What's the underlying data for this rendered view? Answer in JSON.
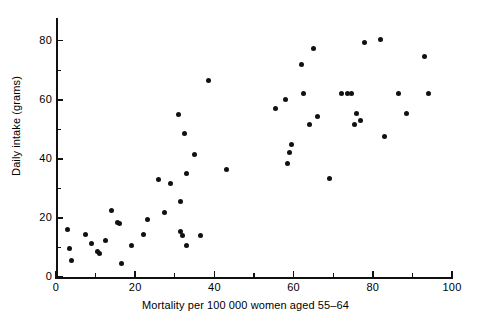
{
  "chart_data": {
    "type": "scatter",
    "title": "",
    "xlabel": "Mortality per 100 000 women aged 55–64",
    "ylabel": "Daily intake (grams)",
    "xlim": [
      0,
      100
    ],
    "ylim": [
      0,
      87
    ],
    "grid": false,
    "legend": null,
    "x_ticks_major": [
      0,
      20,
      40,
      60,
      80,
      100
    ],
    "x_tick_labels": [
      "0",
      "20",
      "40",
      "60",
      "80",
      "100"
    ],
    "x_ticks_minor": [
      10,
      30,
      50,
      70,
      90
    ],
    "y_ticks_major": [
      0,
      20,
      40,
      60,
      80
    ],
    "y_tick_labels": [
      "0",
      "20",
      "40",
      "60",
      "80"
    ],
    "y_ticks_minor": [
      10,
      30,
      50,
      70
    ],
    "marker": "filled-circle",
    "marker_color": "#111111",
    "points": [
      {
        "x": 3.0,
        "y": 16.0
      },
      {
        "x": 3.5,
        "y": 9.5
      },
      {
        "x": 4.0,
        "y": 5.5
      },
      {
        "x": 7.5,
        "y": 14.5
      },
      {
        "x": 9.0,
        "y": 11.5
      },
      {
        "x": 10.5,
        "y": 8.5
      },
      {
        "x": 11.0,
        "y": 8.0
      },
      {
        "x": 12.5,
        "y": 12.5
      },
      {
        "x": 14.0,
        "y": 22.5
      },
      {
        "x": 15.5,
        "y": 18.5
      },
      {
        "x": 16.0,
        "y": 18.0
      },
      {
        "x": 16.5,
        "y": 4.5
      },
      {
        "x": 19.0,
        "y": 10.5
      },
      {
        "x": 22.0,
        "y": 14.5
      },
      {
        "x": 23.0,
        "y": 19.5
      },
      {
        "x": 26.0,
        "y": 33.0
      },
      {
        "x": 27.5,
        "y": 22.0
      },
      {
        "x": 29.0,
        "y": 31.5
      },
      {
        "x": 31.0,
        "y": 55.0
      },
      {
        "x": 31.5,
        "y": 25.5
      },
      {
        "x": 31.5,
        "y": 15.5
      },
      {
        "x": 32.0,
        "y": 14.0
      },
      {
        "x": 32.5,
        "y": 48.5
      },
      {
        "x": 33.0,
        "y": 35.0
      },
      {
        "x": 33.0,
        "y": 10.5
      },
      {
        "x": 35.0,
        "y": 41.5
      },
      {
        "x": 36.5,
        "y": 14.0
      },
      {
        "x": 38.5,
        "y": 66.5
      },
      {
        "x": 43.0,
        "y": 36.5
      },
      {
        "x": 55.5,
        "y": 57.0
      },
      {
        "x": 58.0,
        "y": 60.0
      },
      {
        "x": 58.5,
        "y": 38.5
      },
      {
        "x": 59.0,
        "y": 42.0
      },
      {
        "x": 59.5,
        "y": 45.0
      },
      {
        "x": 62.0,
        "y": 72.0
      },
      {
        "x": 62.5,
        "y": 62.0
      },
      {
        "x": 64.0,
        "y": 51.5
      },
      {
        "x": 65.0,
        "y": 77.5
      },
      {
        "x": 66.0,
        "y": 54.5
      },
      {
        "x": 69.0,
        "y": 33.5
      },
      {
        "x": 72.0,
        "y": 62.0
      },
      {
        "x": 73.5,
        "y": 62.0
      },
      {
        "x": 74.5,
        "y": 62.0
      },
      {
        "x": 75.5,
        "y": 51.5
      },
      {
        "x": 76.0,
        "y": 55.5
      },
      {
        "x": 77.0,
        "y": 53.0
      },
      {
        "x": 78.0,
        "y": 79.5
      },
      {
        "x": 82.0,
        "y": 80.5
      },
      {
        "x": 83.0,
        "y": 47.5
      },
      {
        "x": 86.5,
        "y": 62.0
      },
      {
        "x": 88.5,
        "y": 55.5
      },
      {
        "x": 93.0,
        "y": 74.5
      },
      {
        "x": 94.0,
        "y": 62.0
      }
    ]
  }
}
